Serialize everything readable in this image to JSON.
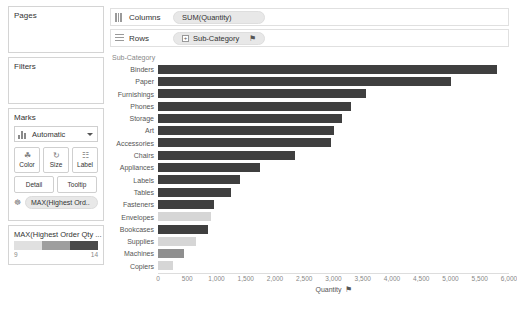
{
  "sidebar": {
    "pages": {
      "title": "Pages"
    },
    "filters": {
      "title": "Filters"
    },
    "marks": {
      "title": "Marks",
      "mark_type": "Automatic",
      "buttons": [
        {
          "name": "color",
          "label": "Color",
          "glyph": "☘"
        },
        {
          "name": "size",
          "label": "Size",
          "glyph": "↻"
        },
        {
          "name": "label",
          "label": "Label",
          "glyph": "☷"
        }
      ],
      "buttons_row2": [
        {
          "name": "detail",
          "label": "Detail"
        },
        {
          "name": "tooltip",
          "label": "Tooltip"
        }
      ],
      "color_pill": "MAX(Highest Ord.."
    },
    "legend": {
      "title": "MAX(Highest Order Qty ...",
      "min": "9",
      "max": "14",
      "ramp": [
        "#e0e0e0",
        "#9e9e9e",
        "#4a4a4a"
      ]
    }
  },
  "shelves": {
    "columns": {
      "label": "Columns",
      "pill": "SUM(Quantity)"
    },
    "rows": {
      "label": "Rows",
      "pill": "Sub-Category",
      "plus": "+",
      "sort": "⚑"
    }
  },
  "chart_data": {
    "type": "bar",
    "title": "",
    "orientation": "horizontal",
    "header": "Sub-Category",
    "xlabel": "Quantity",
    "ylabel": "Sub-Category",
    "xlim": [
      0,
      6000
    ],
    "xticks": [
      "0",
      "500",
      "1,000",
      "1,500",
      "2,000",
      "2,500",
      "3,000",
      "3,500",
      "4,000",
      "4,500",
      "5,000",
      "5,500",
      "6,000"
    ],
    "grid": false,
    "legend_position": "left-sidebar",
    "color_field": "MAX(Highest Order Qty)",
    "color_range": [
      9,
      14
    ],
    "categories": [
      "Binders",
      "Paper",
      "Furnishings",
      "Phones",
      "Storage",
      "Art",
      "Accessories",
      "Chairs",
      "Appliances",
      "Labels",
      "Tables",
      "Fasteners",
      "Envelopes",
      "Bookcases",
      "Supplies",
      "Machines",
      "Copiers"
    ],
    "values": [
      5800,
      5000,
      3550,
      3300,
      3150,
      3000,
      2950,
      2350,
      1750,
      1400,
      1250,
      950,
      900,
      850,
      650,
      450,
      250
    ],
    "colors": [
      "#3f3f3f",
      "#3f3f3f",
      "#3f3f3f",
      "#3f3f3f",
      "#3f3f3f",
      "#3f3f3f",
      "#3f3f3f",
      "#3f3f3f",
      "#3f3f3f",
      "#3f3f3f",
      "#3f3f3f",
      "#3f3f3f",
      "#d6d6d6",
      "#3f3f3f",
      "#d6d6d6",
      "#8f8f8f",
      "#d6d6d6"
    ],
    "color_values": [
      14,
      14,
      14,
      14,
      14,
      14,
      14,
      14,
      14,
      14,
      14,
      14,
      9,
      14,
      9,
      11,
      9
    ]
  }
}
